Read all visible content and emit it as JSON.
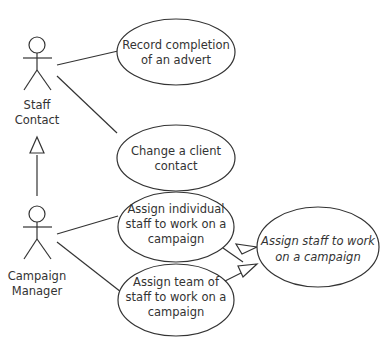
{
  "diagram": {
    "type": "UML use case diagram",
    "actors": [
      {
        "id": "staff_contact",
        "label_lines": [
          "Staff",
          "Contact"
        ]
      },
      {
        "id": "campaign_manager",
        "label_lines": [
          "Campaign",
          "Manager"
        ]
      }
    ],
    "use_cases": [
      {
        "id": "record_completion",
        "label_lines": [
          "Record completion",
          "of an advert"
        ],
        "abstract": false
      },
      {
        "id": "change_client_contact",
        "label_lines": [
          "Change a client",
          "contact"
        ],
        "abstract": false
      },
      {
        "id": "assign_individual",
        "label_lines": [
          "Assign individual",
          "staff to work on a",
          "campaign"
        ],
        "abstract": false
      },
      {
        "id": "assign_team",
        "label_lines": [
          "Assign team of",
          "staff to work on a",
          "campaign"
        ],
        "abstract": false
      },
      {
        "id": "assign_staff",
        "label_lines": [
          "Assign staff to work",
          "on a campaign"
        ],
        "abstract": true
      }
    ],
    "associations": [
      {
        "from": "staff_contact",
        "to": "record_completion"
      },
      {
        "from": "staff_contact",
        "to": "change_client_contact"
      },
      {
        "from": "campaign_manager",
        "to": "assign_individual"
      },
      {
        "from": "campaign_manager",
        "to": "assign_team"
      }
    ],
    "generalizations": [
      {
        "child": "campaign_manager",
        "parent": "staff_contact"
      },
      {
        "child": "assign_individual",
        "parent": "assign_staff"
      },
      {
        "child": "assign_team",
        "parent": "assign_staff"
      }
    ],
    "colors": {
      "line": "#333333",
      "background": "#ffffff",
      "text": "#333333"
    }
  }
}
